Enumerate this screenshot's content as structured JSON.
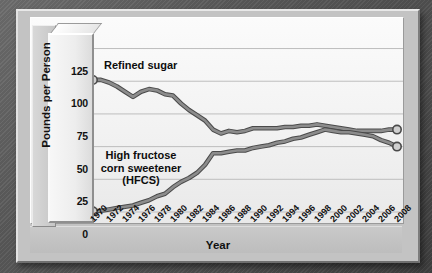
{
  "chart_data": {
    "type": "line",
    "title": "",
    "xlabel": "Year",
    "ylabel": "Pounds per Person",
    "xlim": [
      1970,
      2008
    ],
    "ylim": [
      0,
      130
    ],
    "yticks": [
      0,
      25,
      50,
      75,
      100,
      125
    ],
    "grid": true,
    "legend_position": "inline-annotations",
    "x": [
      1970,
      1971,
      1972,
      1973,
      1974,
      1975,
      1976,
      1977,
      1978,
      1979,
      1980,
      1981,
      1982,
      1983,
      1984,
      1985,
      1986,
      1987,
      1988,
      1989,
      1990,
      1991,
      1992,
      1993,
      1994,
      1995,
      1996,
      1997,
      1998,
      1999,
      2000,
      2001,
      2002,
      2003,
      2004,
      2005,
      2006,
      2007,
      2008
    ],
    "xticks": [
      "1970",
      "1972",
      "1974",
      "1976",
      "1978",
      "1980",
      "1982",
      "1984",
      "1986",
      "1988",
      "1990",
      "1992",
      "1994",
      "1996",
      "1998",
      "2000",
      "2002",
      "2004",
      "2006",
      "2008"
    ],
    "series": [
      {
        "name": "Refined sugar",
        "label": "Refined sugar",
        "color": "#8c8c8c",
        "outline": "#4a4a4a",
        "marker_start": true,
        "marker_end": true,
        "values": [
          101,
          101,
          99,
          96,
          92,
          88,
          92,
          94,
          93,
          90,
          89,
          83,
          78,
          74,
          70,
          63,
          60,
          62,
          61,
          62,
          64,
          64,
          64,
          64,
          65,
          65,
          66,
          66,
          67,
          66,
          65,
          64,
          63,
          62,
          62,
          62,
          62,
          63,
          63
        ]
      },
      {
        "name": "High fructose corn sweetener (HFCS)",
        "label_lines": [
          "High fructose",
          "corn sweetener",
          "(HFCS)"
        ],
        "color": "#8c8c8c",
        "outline": "#4a4a4a",
        "marker_start": true,
        "marker_end": true,
        "values": [
          0.5,
          1,
          2,
          3,
          4,
          5,
          7,
          9,
          12,
          14,
          19,
          23,
          26,
          30,
          36,
          45,
          45,
          46,
          47,
          47,
          49,
          50,
          51,
          53,
          54,
          56,
          57,
          59,
          61,
          63,
          62,
          61,
          61,
          60,
          59,
          58,
          55,
          53,
          50
        ]
      }
    ]
  },
  "annotations": {
    "refined_sugar_label": "Refined sugar",
    "hfcs_label_line1": "High fructose",
    "hfcs_label_line2": "corn sweetener",
    "hfcs_label_line3": "(HFCS)"
  }
}
